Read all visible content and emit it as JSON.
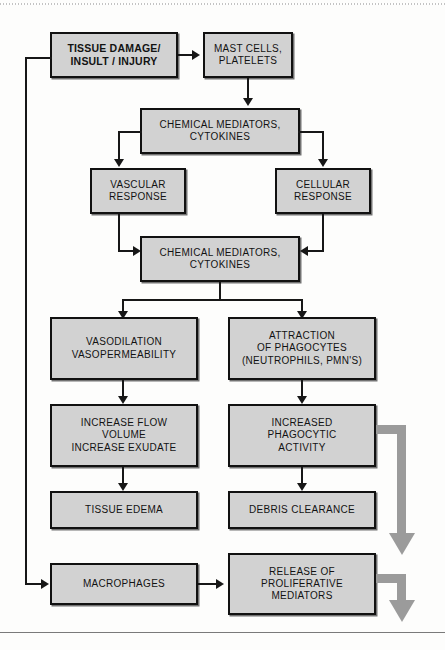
{
  "diagram": {
    "colors": {
      "node_fill": "#d2d2d2",
      "node_border": "#111111",
      "connector": "#171717",
      "gray_arrow": "#9b9b9b",
      "page_background": "#fdfdfc"
    },
    "nodes": [
      {
        "id": "tissue_damage",
        "label": "TISSUE DAMAGE/\nINSULT / INJURY"
      },
      {
        "id": "mast_cells",
        "label": "MAST CELLS,\nPLATELETS"
      },
      {
        "id": "chem_med_1",
        "label": "CHEMICAL MEDIATORS,\nCYTOKINES"
      },
      {
        "id": "vascular_response",
        "label": "VASCULAR\nRESPONSE"
      },
      {
        "id": "cellular_response",
        "label": "CELLULAR\nRESPONSE"
      },
      {
        "id": "chem_med_2",
        "label": "CHEMICAL MEDIATORS,\nCYTOKINES"
      },
      {
        "id": "vasodilation",
        "label": "VASODILATION\nVASOPERMEABILITY"
      },
      {
        "id": "attraction",
        "label": "ATTRACTION\nOF PHAGOCYTES\n(NEUTROPHILS, PMN'S)"
      },
      {
        "id": "increase_flow",
        "label": "INCREASE FLOW\nVOLUME\nINCREASE EXUDATE"
      },
      {
        "id": "increased_phagocytic",
        "label": "INCREASED\nPHAGOCYTIC\nACTIVITY"
      },
      {
        "id": "tissue_edema",
        "label": "TISSUE EDEMA"
      },
      {
        "id": "debris_clearance",
        "label": "DEBRIS CLEARANCE"
      },
      {
        "id": "macrophages",
        "label": "MACROPHAGES"
      },
      {
        "id": "release_prolif",
        "label": "RELEASE OF\nPROLIFERATIVE\nMEDIATORS"
      }
    ]
  }
}
